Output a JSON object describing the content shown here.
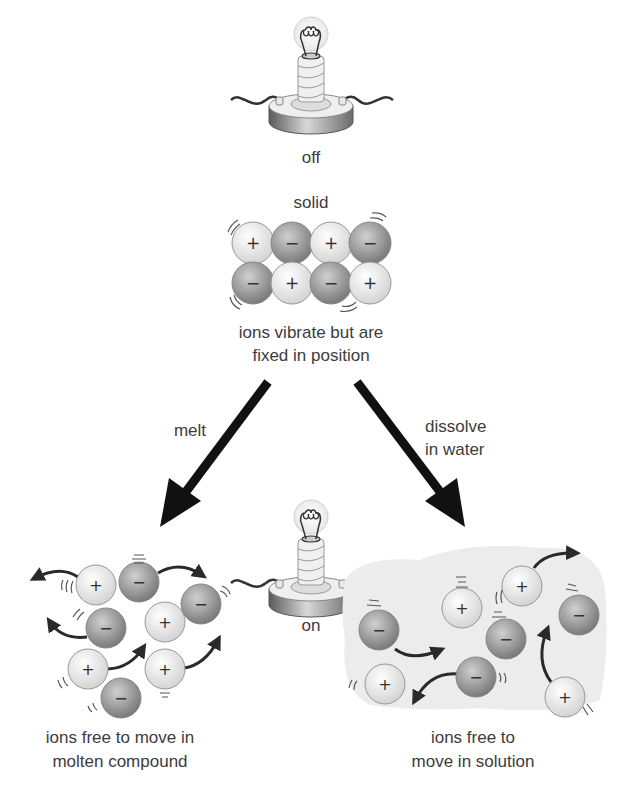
{
  "bulb_off": {
    "label": "off",
    "state": "off"
  },
  "solid": {
    "heading": "solid",
    "caption_line1": "ions vibrate but are",
    "caption_line2": "fixed in position",
    "lattice": [
      [
        "+",
        "−",
        "+",
        "−"
      ],
      [
        "−",
        "+",
        "−",
        "+"
      ]
    ]
  },
  "arrows": {
    "left": {
      "label": "melt"
    },
    "right": {
      "label_line1": "dissolve",
      "label_line2": "in water"
    }
  },
  "bulb_on": {
    "label": "on",
    "state": "on"
  },
  "molten": {
    "caption_line1": "ions free to move in",
    "caption_line2": "molten compound"
  },
  "solution": {
    "caption_line1": "ions free to",
    "caption_line2": "move in solution"
  },
  "symbols": {
    "positive": "+",
    "negative": "−"
  },
  "colors": {
    "positive_ion": "#f4f4f4",
    "negative_ion": "#9a9a9a",
    "arrow": "#111111",
    "water": "#ececec",
    "text": "#3c3c3c"
  }
}
